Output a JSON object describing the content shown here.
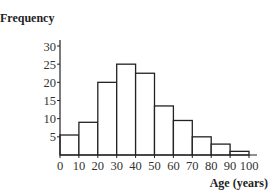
{
  "chart_data": {
    "type": "bar",
    "subtype": "histogram",
    "title": "",
    "xlabel": "Age (years)",
    "ylabel": "Frequency",
    "bins": [
      [
        0,
        10
      ],
      [
        10,
        20
      ],
      [
        20,
        30
      ],
      [
        30,
        40
      ],
      [
        40,
        50
      ],
      [
        50,
        60
      ],
      [
        60,
        70
      ],
      [
        70,
        80
      ],
      [
        80,
        90
      ],
      [
        90,
        100
      ]
    ],
    "categories": [
      "0-10",
      "10-20",
      "20-30",
      "30-40",
      "40-50",
      "50-60",
      "60-70",
      "70-80",
      "80-90",
      "90-100"
    ],
    "values": [
      5.5,
      9,
      20,
      25,
      22.5,
      13.5,
      9.5,
      5,
      3,
      1
    ],
    "xticks": [
      0,
      10,
      20,
      30,
      40,
      50,
      60,
      70,
      80,
      90,
      100
    ],
    "yticks": [
      5,
      10,
      15,
      20,
      25,
      30
    ],
    "xlim": [
      0,
      100
    ],
    "ylim": [
      0,
      30
    ],
    "grid": false,
    "legend": null,
    "bar_fill": "#ffffff",
    "bar_stroke": "#222222"
  }
}
